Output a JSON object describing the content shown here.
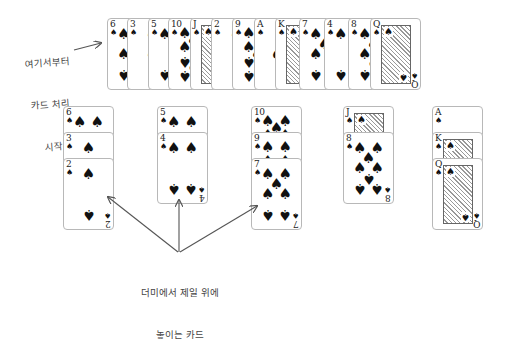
{
  "annotations": {
    "deal_start": {
      "line1": "여기서부터",
      "line2": "카드 처리",
      "line3": "시작"
    },
    "top_card": {
      "line1": "더미에서 제일 위에",
      "line2": "놓이는 카드"
    }
  },
  "suit_symbol": "♠",
  "deck_row": {
    "label": "dealing row",
    "cards": [
      "6",
      "3",
      "5",
      "10",
      "J",
      "2",
      "9",
      "A",
      "K",
      "7",
      "4",
      "8",
      "Q"
    ]
  },
  "piles": [
    {
      "label": "pile 1",
      "cards": [
        "6",
        "3",
        "2"
      ]
    },
    {
      "label": "pile 2",
      "cards": [
        "5",
        "4"
      ]
    },
    {
      "label": "pile 3",
      "cards": [
        "10",
        "9",
        "7"
      ]
    },
    {
      "label": "pile 4",
      "cards": [
        "J",
        "8"
      ]
    },
    {
      "label": "pile 5",
      "cards": [
        "A",
        "K",
        "Q"
      ]
    }
  ],
  "colors": {
    "card_border": "#b8b8b8",
    "ink": "#111111",
    "arrow": "#555555"
  }
}
